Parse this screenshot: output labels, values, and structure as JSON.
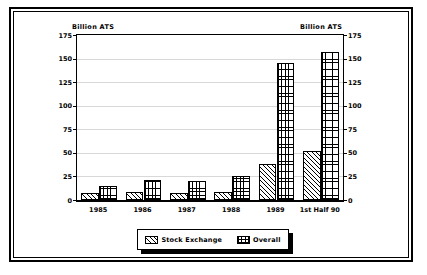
{
  "chart_data": {
    "type": "bar",
    "title": "",
    "subtitle": "",
    "xlabel": "",
    "ylabel": "Billion ATS",
    "ylabel_right": "Billion ATS",
    "categories": [
      "1985",
      "1986",
      "1987",
      "1988",
      "1989",
      "1st Half 90"
    ],
    "series": [
      {
        "name": "Stock Exchange",
        "values": [
          7,
          8,
          7,
          8,
          38,
          52
        ],
        "pattern": "diagonal-hatch"
      },
      {
        "name": "Overall",
        "values": [
          15,
          21,
          20,
          25,
          145,
          157
        ],
        "pattern": "cross-hatch-grid"
      }
    ],
    "ylim": [
      0,
      175
    ],
    "yticks": [
      0,
      25,
      50,
      75,
      100,
      125,
      150,
      175
    ],
    "ytick_labels": [
      "0",
      "25",
      "50",
      "75",
      "100",
      "125",
      "150",
      "175"
    ],
    "grid": true,
    "grid_axis": "y",
    "legend_position": "bottom-center",
    "dual_axis": true,
    "units": "Billion ATS"
  },
  "legend": {
    "items": [
      {
        "label": "Stock Exchange",
        "icon": "diagonal-hatch-swatch"
      },
      {
        "label": "Overall",
        "icon": "grid-hatch-swatch"
      }
    ]
  },
  "colors": {
    "frame": "#000000",
    "background": "#ffffff",
    "gridline": "#d8d8d8",
    "bar_outline": "#000000",
    "text": "#000000"
  }
}
